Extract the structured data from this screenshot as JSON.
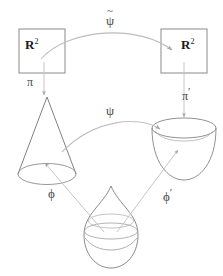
{
  "diagram": {
    "type": "commutative-diagram",
    "nodes": {
      "top_left": {
        "label": "R",
        "exponent": "2",
        "name": "R-squared-left"
      },
      "top_right": {
        "label": "R",
        "exponent": "2",
        "name": "R-squared-right"
      },
      "middle_left": {
        "shape": "cone",
        "name": "cone-surface"
      },
      "middle_right": {
        "shape": "bowl",
        "name": "bowl-surface"
      },
      "bottom": {
        "shape": "teardrop",
        "name": "teardrop-surface"
      }
    },
    "arrows": {
      "psi_tilde": {
        "label": "ψ",
        "accent": "~",
        "name": "psi-tilde-arrow",
        "from": "top_left",
        "to": "top_right"
      },
      "pi": {
        "label": "π",
        "name": "pi-arrow",
        "from": "top_left",
        "to": "middle_left"
      },
      "pi_prime": {
        "label": "π",
        "prime": "′",
        "name": "pi-prime-arrow",
        "from": "top_right",
        "to": "middle_right"
      },
      "psi": {
        "label": "ψ",
        "name": "psi-arrow",
        "from": "middle_left",
        "to": "middle_right"
      },
      "phi": {
        "label": "ϕ",
        "name": "phi-arrow",
        "from": "bottom",
        "to": "middle_left"
      },
      "phi_prime": {
        "label": "ϕ",
        "prime": "′",
        "name": "phi-prime-arrow",
        "from": "bottom",
        "to": "middle_right"
      }
    },
    "colors": {
      "box_stroke": "#8a8a8a",
      "shape_stroke": "#808080",
      "arrow_stroke": "#b4b4b4",
      "text": "#3a3a3a",
      "background": "#ffffff"
    }
  }
}
